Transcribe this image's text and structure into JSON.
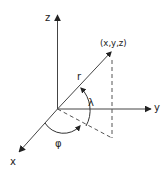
{
  "diagram": {
    "axes": {
      "x": "x",
      "y": "y",
      "z": "z"
    },
    "point_label": "(x,y,z)",
    "radius_label": "r",
    "elevation_angle_label": "λ",
    "azimuth_angle_label": "φ",
    "colors": {
      "line": "#333333",
      "dashed": "#555555",
      "background": "#ffffff"
    }
  }
}
